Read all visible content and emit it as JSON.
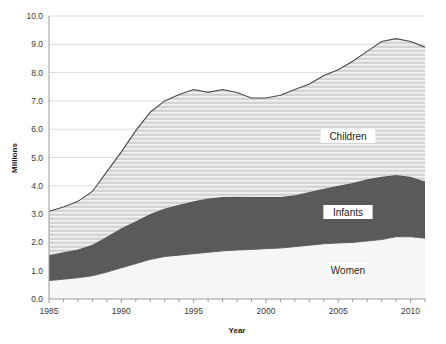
{
  "chart_data": {
    "type": "area",
    "stacked": true,
    "title": "",
    "xlabel": "Year",
    "ylabel": "Millions",
    "xlim": [
      1985,
      2011
    ],
    "ylim": [
      0,
      10
    ],
    "ytick_step": 1.0,
    "grid": true,
    "grid_axis": "y",
    "legend_position": "inline-labels",
    "x": [
      1985,
      1986,
      1987,
      1988,
      1989,
      1990,
      1991,
      1992,
      1993,
      1994,
      1995,
      1996,
      1997,
      1998,
      1999,
      2000,
      2001,
      2002,
      2003,
      2004,
      2005,
      2006,
      2007,
      2008,
      2009,
      2010,
      2011
    ],
    "xtick_labels": [
      "1985",
      "1990",
      "1995",
      "2000",
      "2005",
      "2010"
    ],
    "xtick_values": [
      1985,
      1990,
      1995,
      2000,
      2005,
      2010
    ],
    "ytick_labels": [
      "0.0",
      "1.0",
      "2.0",
      "3.0",
      "4.0",
      "5.0",
      "6.0",
      "7.0",
      "8.0",
      "9.0",
      "10.0"
    ],
    "ytick_values": [
      0,
      1,
      2,
      3,
      4,
      5,
      6,
      7,
      8,
      9,
      10
    ],
    "series": [
      {
        "name": "Women",
        "label": "Women",
        "color": "#f6f6f6",
        "fill_pattern": "solid",
        "values": [
          0.65,
          0.7,
          0.75,
          0.82,
          0.95,
          1.1,
          1.25,
          1.4,
          1.5,
          1.55,
          1.6,
          1.65,
          1.7,
          1.73,
          1.75,
          1.78,
          1.8,
          1.85,
          1.9,
          1.95,
          1.98,
          2.0,
          2.05,
          2.1,
          2.2,
          2.2,
          2.15
        ]
      },
      {
        "name": "Infants",
        "label": "Infants",
        "color": "#5a5a5a",
        "fill_pattern": "solid",
        "values": [
          0.9,
          0.95,
          1.0,
          1.1,
          1.25,
          1.4,
          1.5,
          1.6,
          1.7,
          1.78,
          1.85,
          1.9,
          1.9,
          1.88,
          1.85,
          1.82,
          1.8,
          1.82,
          1.88,
          1.95,
          2.02,
          2.1,
          2.18,
          2.22,
          2.18,
          2.12,
          2.0
        ]
      },
      {
        "name": "Children",
        "label": "Children",
        "color": "#d4d4d4",
        "fill_pattern": "horizontal-hatch",
        "values": [
          1.55,
          1.6,
          1.7,
          1.88,
          2.3,
          2.7,
          3.2,
          3.6,
          3.8,
          3.9,
          3.95,
          3.75,
          3.8,
          3.69,
          3.5,
          3.5,
          3.6,
          3.73,
          3.82,
          4.0,
          4.1,
          4.3,
          4.52,
          4.78,
          4.82,
          4.78,
          4.75
        ]
      }
    ],
    "stack_totals": [
      3.1,
      3.25,
      3.45,
      3.8,
      4.5,
      5.2,
      5.95,
      6.6,
      7.0,
      7.23,
      7.4,
      7.3,
      7.4,
      7.3,
      7.1,
      7.1,
      7.2,
      7.4,
      7.6,
      7.9,
      8.1,
      8.4,
      8.75,
      9.1,
      9.2,
      9.1,
      8.9
    ]
  },
  "axis": {
    "y_title": "Millions",
    "x_title": "Year"
  }
}
